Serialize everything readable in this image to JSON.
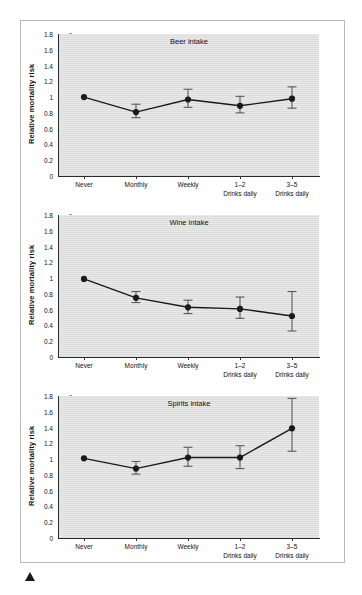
{
  "figure": {
    "marker_icon": "filled-circle-marker",
    "triangle_icon": "solid-triangle-marker",
    "line_color": "#1a1a1a",
    "plot_background": "#dcdcdc",
    "axis_color": "#2b2b2b"
  },
  "chart_data": [
    {
      "type": "line",
      "title": "Beer intake",
      "xlabel": "",
      "ylabel": "Relative mortality risk",
      "ylim": [
        0,
        1.8
      ],
      "yticks": [
        "0",
        "0.2",
        "0.4",
        "0.6",
        "0.8",
        "1",
        "1.2",
        "1.4",
        "1.6",
        "1.8"
      ],
      "ytick_values": [
        0,
        0.2,
        0.4,
        0.6,
        0.8,
        1.0,
        1.2,
        1.4,
        1.6,
        1.8
      ],
      "categories": [
        "Never",
        "Monthly",
        "Weekly",
        "1–2",
        "3–5"
      ],
      "category_sublabels": [
        "",
        "",
        "",
        "Drinks daily",
        "Drinks daily"
      ],
      "values": [
        1.0,
        0.81,
        0.97,
        0.89,
        0.98
      ],
      "error_low": [
        1.0,
        0.74,
        0.87,
        0.8,
        0.86
      ],
      "error_high": [
        1.0,
        0.91,
        1.1,
        1.01,
        1.13
      ],
      "grid": false,
      "legend": "none"
    },
    {
      "type": "line",
      "title": "Wine intake",
      "xlabel": "",
      "ylabel": "Relative mortality risk",
      "ylim": [
        0,
        1.8
      ],
      "yticks": [
        "0",
        "0.2",
        "0.4",
        "0.6",
        "0.8",
        "1",
        "1.2",
        "1.4",
        "1.6",
        "1.8"
      ],
      "ytick_values": [
        0,
        0.2,
        0.4,
        0.6,
        0.8,
        1.0,
        1.2,
        1.4,
        1.6,
        1.8
      ],
      "categories": [
        "Never",
        "Monthly",
        "Weekly",
        "1–2",
        "3–5"
      ],
      "category_sublabels": [
        "",
        "",
        "",
        "Drinks daily",
        "Drinks daily"
      ],
      "values": [
        0.99,
        0.75,
        0.63,
        0.61,
        0.52
      ],
      "error_low": [
        0.99,
        0.69,
        0.55,
        0.49,
        0.33
      ],
      "error_high": [
        0.99,
        0.83,
        0.72,
        0.76,
        0.83
      ],
      "grid": false,
      "legend": "none"
    },
    {
      "type": "line",
      "title": "Spirits intake",
      "xlabel": "",
      "ylabel": "Relative mortality risk",
      "ylim": [
        0,
        1.8
      ],
      "yticks": [
        "0",
        "0.2",
        "0.4",
        "0.6",
        "0.8",
        "1",
        "1.2",
        "1.4",
        "1.6",
        "1.8"
      ],
      "ytick_values": [
        0,
        0.2,
        0.4,
        0.6,
        0.8,
        1.0,
        1.2,
        1.4,
        1.6,
        1.8
      ],
      "categories": [
        "Never",
        "Monthly",
        "Weekly",
        "1–2",
        "3–5"
      ],
      "category_sublabels": [
        "",
        "",
        "",
        "Drinks daily",
        "Drinks daily"
      ],
      "values": [
        1.01,
        0.88,
        1.02,
        1.02,
        1.39
      ],
      "error_low": [
        1.01,
        0.81,
        0.91,
        0.88,
        1.1
      ],
      "error_high": [
        1.01,
        0.97,
        1.15,
        1.17,
        1.77
      ],
      "grid": false,
      "legend": "none"
    }
  ]
}
